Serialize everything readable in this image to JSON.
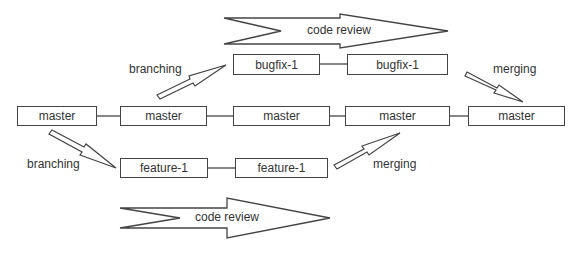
{
  "diagram": {
    "title": "",
    "master_row": [
      {
        "label": "master"
      },
      {
        "label": "master"
      },
      {
        "label": "master"
      },
      {
        "label": "master"
      },
      {
        "label": "master"
      }
    ],
    "bugfix_row": [
      {
        "label": "bugfix-1"
      },
      {
        "label": "bugfix-1"
      }
    ],
    "feature_row": [
      {
        "label": "feature-1"
      },
      {
        "label": "feature-1"
      }
    ],
    "annotations": {
      "branching_top": "branching",
      "merging_top": "merging",
      "branching_bottom": "branching",
      "merging_bottom": "merging",
      "review_top": "code review",
      "review_bottom": "code review"
    },
    "colors": {
      "stroke": "#444444",
      "text": "#333333",
      "background": "#ffffff"
    }
  }
}
